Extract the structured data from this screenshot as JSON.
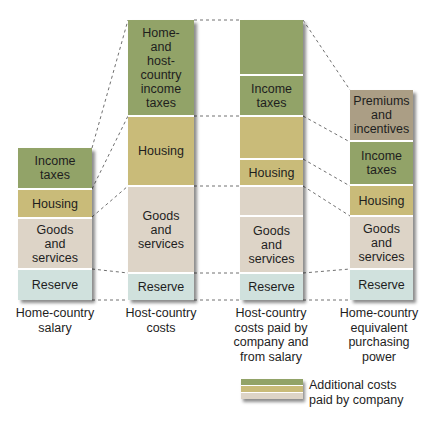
{
  "colors": {
    "income_taxes": "#92a368",
    "housing": "#c9bb79",
    "goods_and_services": "#ddd4c7",
    "reserve": "#d0e1dd",
    "premiums_and_incentives": "#ab9e85"
  },
  "columns": [
    {
      "caption": "Home-country salary",
      "caption_lines": [
        "Home-country",
        "salary"
      ],
      "segments": [
        {
          "label_lines": [
            "Income",
            "taxes"
          ],
          "category": "income_taxes"
        },
        {
          "label_lines": [
            "Housing"
          ],
          "category": "housing"
        },
        {
          "label_lines": [
            "Goods",
            "and",
            "services"
          ],
          "category": "goods_and_services"
        },
        {
          "label_lines": [
            "Reserve"
          ],
          "category": "reserve"
        }
      ]
    },
    {
      "caption": "Host-country costs",
      "caption_lines": [
        "Host-country",
        "costs"
      ],
      "segments": [
        {
          "label_lines": [
            "Home-",
            "and",
            "host-",
            "country",
            "income",
            "taxes"
          ],
          "category": "income_taxes"
        },
        {
          "label_lines": [
            "Housing"
          ],
          "category": "housing"
        },
        {
          "label_lines": [
            "Goods",
            "and",
            "services"
          ],
          "category": "goods_and_services"
        },
        {
          "label_lines": [
            "Reserve"
          ],
          "category": "reserve"
        }
      ]
    },
    {
      "caption": "Host-country costs paid by company and from salary",
      "caption_lines": [
        "Host-country",
        "costs paid by",
        "company and",
        "from salary"
      ],
      "segments": [
        {
          "label_lines": [
            ""
          ],
          "category": "income_taxes",
          "paid_by": "company"
        },
        {
          "label_lines": [
            "Income",
            "taxes"
          ],
          "category": "income_taxes"
        },
        {
          "label_lines": [
            ""
          ],
          "category": "housing",
          "paid_by": "company"
        },
        {
          "label_lines": [
            "Housing"
          ],
          "category": "housing"
        },
        {
          "label_lines": [
            ""
          ],
          "category": "goods_and_services",
          "paid_by": "company"
        },
        {
          "label_lines": [
            "Goods",
            "and",
            "services"
          ],
          "category": "goods_and_services"
        },
        {
          "label_lines": [
            "Reserve"
          ],
          "category": "reserve"
        }
      ]
    },
    {
      "caption": "Home-country equivalent purchasing power",
      "caption_lines": [
        "Home-country",
        "equivalent",
        "purchasing",
        "power"
      ],
      "segments": [
        {
          "label_lines": [
            "Premiums",
            "and",
            "incentives"
          ],
          "category": "premiums_and_incentives"
        },
        {
          "label_lines": [
            "Income",
            "taxes"
          ],
          "category": "income_taxes"
        },
        {
          "label_lines": [
            "Housing"
          ],
          "category": "housing"
        },
        {
          "label_lines": [
            "Goods",
            "and",
            "services"
          ],
          "category": "goods_and_services"
        },
        {
          "label_lines": [
            "Reserve"
          ],
          "category": "reserve"
        }
      ]
    }
  ],
  "legend": {
    "text_lines": [
      "Additional costs",
      "paid by company"
    ],
    "text": "Additional costs paid by company"
  }
}
